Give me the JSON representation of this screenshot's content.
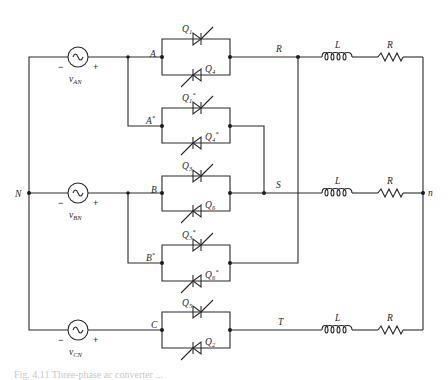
{
  "diagram": {
    "type": "circuit-schematic",
    "sources": [
      {
        "id": "vAN",
        "label": "v",
        "sub": "AN",
        "minus": "−",
        "plus": "+"
      },
      {
        "id": "vBN",
        "label": "v",
        "sub": "BN",
        "minus": "−",
        "plus": "+"
      },
      {
        "id": "vCN",
        "label": "v",
        "sub": "CN",
        "minus": "−",
        "plus": "+"
      }
    ],
    "nodes": {
      "neutral": "N",
      "load_star": "n",
      "A": "A",
      "A_star": "A",
      "A_star_mark": "*",
      "B": "B",
      "B_star": "B",
      "B_star_mark": "*",
      "C": "C",
      "R_line": "R",
      "S_line": "S",
      "T_line": "T"
    },
    "thyristors": [
      {
        "label": "Q",
        "sub": "1",
        "mark": ""
      },
      {
        "label": "Q",
        "sub": "4",
        "mark": ""
      },
      {
        "label": "Q",
        "sub": "1",
        "mark": "*"
      },
      {
        "label": "Q",
        "sub": "4",
        "mark": "*"
      },
      {
        "label": "Q",
        "sub": "3",
        "mark": ""
      },
      {
        "label": "Q",
        "sub": "6",
        "mark": ""
      },
      {
        "label": "Q",
        "sub": "3",
        "mark": "*"
      },
      {
        "label": "Q",
        "sub": "6",
        "mark": "*"
      },
      {
        "label": "Q",
        "sub": "5",
        "mark": ""
      },
      {
        "label": "Q",
        "sub": "2",
        "mark": ""
      }
    ],
    "load": {
      "inductor_label": "L",
      "resistor_label": "R"
    }
  },
  "caption": {
    "text": "Fig. 4.11  Three-phase ac converter ..."
  }
}
